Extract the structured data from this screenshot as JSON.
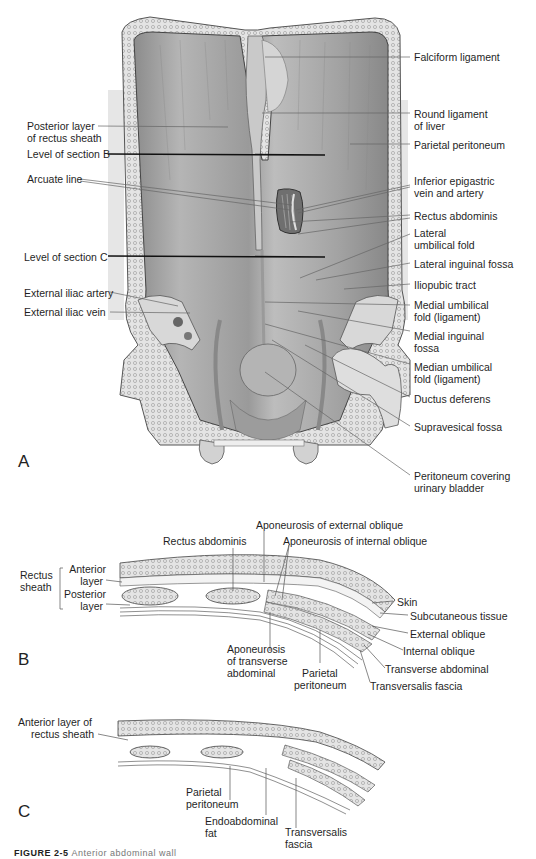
{
  "figure": {
    "caption_prefix": "FIGURE 2-5",
    "caption_text": "Anterior abdominal wall"
  },
  "panel_a": {
    "letter": "A",
    "labels_right": [
      {
        "id": "falciform",
        "text": "Falciform ligament"
      },
      {
        "id": "round-lig-1",
        "text": "Round ligament"
      },
      {
        "id": "round-lig-2",
        "text": "of liver"
      },
      {
        "id": "parietal-peritoneum",
        "text": "Parietal peritoneum"
      },
      {
        "id": "inf-epi-1",
        "text": "Inferior epigastric"
      },
      {
        "id": "inf-epi-2",
        "text": "vein and artery"
      },
      {
        "id": "rectus",
        "text": "Rectus abdominis"
      },
      {
        "id": "lat-umb-1",
        "text": "Lateral"
      },
      {
        "id": "lat-umb-2",
        "text": "umbilical fold"
      },
      {
        "id": "lat-ing",
        "text": "Lateral inguinal fossa"
      },
      {
        "id": "iliopubic",
        "text": "Iliopubic tract"
      },
      {
        "id": "med-umb-1",
        "text": "Medial umbilical"
      },
      {
        "id": "med-umb-2",
        "text": "fold (ligament)"
      },
      {
        "id": "med-ing-1",
        "text": "Medial inguinal"
      },
      {
        "id": "med-ing-2",
        "text": "fossa"
      },
      {
        "id": "median-umb-1",
        "text": "Median umbilical"
      },
      {
        "id": "median-umb-2",
        "text": "fold (ligament)"
      },
      {
        "id": "ductus",
        "text": "Ductus deferens"
      },
      {
        "id": "supravesical",
        "text": "Supravesical fossa"
      },
      {
        "id": "perit-bladder-1",
        "text": "Peritoneum covering"
      },
      {
        "id": "perit-bladder-2",
        "text": "urinary bladder"
      }
    ],
    "labels_left": [
      {
        "id": "post-layer-1",
        "text": "Posterior layer"
      },
      {
        "id": "post-layer-2",
        "text": "of rectus sheath"
      },
      {
        "id": "section-b",
        "text": "Level of section B"
      },
      {
        "id": "arcuate",
        "text": "Arcuate line"
      },
      {
        "id": "section-c",
        "text": "Level of section C"
      },
      {
        "id": "ext-iliac-artery",
        "text": "External iliac artery"
      },
      {
        "id": "ext-iliac-vein",
        "text": "External iliac vein"
      }
    ]
  },
  "panel_b": {
    "letter": "B",
    "labels": {
      "rectus_sheath_1": "Rectus",
      "rectus_sheath_2": "sheath",
      "anterior_1": "Anterior",
      "anterior_2": "layer",
      "posterior_1": "Posterior",
      "posterior_2": "layer",
      "rectus_abdominis": "Rectus abdominis",
      "apo_ext": "Aponeurosis of external oblique",
      "apo_int": "Aponeurosis of internal oblique",
      "skin": "Skin",
      "subcutaneous": "Subcutaneous tissue",
      "external_oblique": "External oblique",
      "internal_oblique": "Internal oblique",
      "transverse_abdominal": "Transverse abdominal",
      "transversalis_fascia": "Transversalis fascia",
      "apo_trans_1": "Aponeurosis",
      "apo_trans_2": "of transverse",
      "apo_trans_3": "abdominal",
      "parietal_1": "Parietal",
      "parietal_2": "peritoneum"
    }
  },
  "panel_c": {
    "letter": "C",
    "labels": {
      "ant_layer_1": "Anterior layer of",
      "ant_layer_2": "rectus sheath",
      "parietal_1": "Parietal",
      "parietal_2": "peritoneum",
      "endo_1": "Endoabdominal",
      "endo_2": "fat",
      "transversalis_1": "Transversalis",
      "transversalis_2": "fascia"
    }
  },
  "colors": {
    "tissue_dark": "#7a7a7a",
    "tissue_mid": "#a8a8a8",
    "tissue_light": "#cfcfcf",
    "bone": "#d9d9d9",
    "line": "#555555",
    "section_line": "#111111"
  }
}
